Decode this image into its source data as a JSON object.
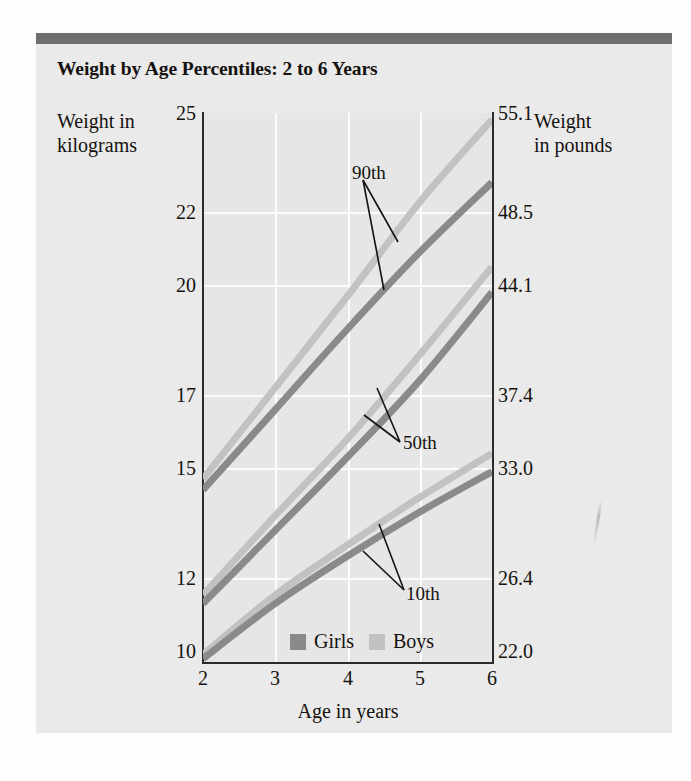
{
  "figure": {
    "background_color": "#fdfdfd",
    "card_color": "#eaeaea",
    "rule_color": "#6f6f6f"
  },
  "title": "Weight by Age Percentiles: 2 to 6 Years",
  "axis_titles": {
    "left": "Weight in\nkilograms",
    "left_line1": "Weight in",
    "left_line2": "kilograms",
    "right_line1": "Weight",
    "right_line2": "in pounds",
    "bottom": "Age in years"
  },
  "legend": {
    "girls_label": "Girls",
    "boys_label": "Boys",
    "girls_color": "#8a8a8a",
    "boys_color": "#c2c2c2"
  },
  "annotations": {
    "p90": "90th",
    "p50": "50th",
    "p10": "10th"
  },
  "chart_data": {
    "type": "line",
    "title": "Weight by Age Percentiles: 2 to 6 Years",
    "xlabel": "Age in years",
    "ylabel": "Weight in kilograms",
    "ylabel_secondary": "Weight in pounds",
    "xlim": [
      2,
      6
    ],
    "ylim": [
      10,
      25
    ],
    "grid": true,
    "legend_position": "bottom-center",
    "x": [
      2,
      3,
      4,
      5,
      6
    ],
    "xticks": [
      "2",
      "3",
      "4",
      "5",
      "6"
    ],
    "yticks_kg": [
      "25",
      "22",
      "20",
      "17",
      "15",
      "12",
      "10"
    ],
    "yticks_kg_values": [
      25,
      22,
      20,
      17,
      15,
      12,
      10
    ],
    "yticks_lb": [
      "55.1",
      "48.5",
      "44.1",
      "37.4",
      "33.0",
      "26.4",
      "22.0"
    ],
    "yticks_lb_values": [
      55.1,
      48.5,
      44.1,
      37.4,
      33.0,
      26.4,
      22.0
    ],
    "series": [
      {
        "name": "Boys 90th",
        "percentile": 90,
        "sex": "Boys",
        "color": "#c2c2c2",
        "values": [
          14.7,
          17.2,
          19.7,
          22.3,
          24.8
        ]
      },
      {
        "name": "Girls 90th",
        "percentile": 90,
        "sex": "Girls",
        "color": "#8a8a8a",
        "values": [
          14.4,
          16.6,
          18.8,
          20.9,
          22.9
        ]
      },
      {
        "name": "Boys 50th",
        "percentile": 50,
        "sex": "Boys",
        "color": "#c2c2c2",
        "values": [
          11.6,
          13.7,
          15.8,
          18.1,
          20.5
        ]
      },
      {
        "name": "Girls 50th",
        "percentile": 50,
        "sex": "Girls",
        "color": "#8a8a8a",
        "values": [
          11.4,
          13.3,
          15.3,
          17.4,
          19.8
        ]
      },
      {
        "name": "Boys 10th",
        "percentile": 10,
        "sex": "Boys",
        "color": "#c2c2c2",
        "values": [
          10.2,
          11.6,
          12.9,
          14.2,
          15.4
        ]
      },
      {
        "name": "Girls 10th",
        "percentile": 10,
        "sex": "Girls",
        "color": "#8a8a8a",
        "values": [
          10.1,
          11.4,
          12.6,
          13.8,
          14.9
        ]
      }
    ]
  }
}
